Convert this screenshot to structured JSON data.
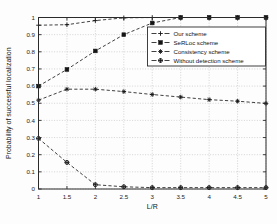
{
  "chart_data": {
    "type": "line",
    "title": "",
    "xlabel": "L/R",
    "ylabel": "Probability of successful localization",
    "xlim": [
      1,
      5
    ],
    "ylim": [
      0,
      1
    ],
    "grid": true,
    "legend_position": "upper right",
    "x": [
      1,
      1.5,
      2,
      2.5,
      3,
      3.5,
      4,
      4.5,
      5
    ],
    "xticks": [
      "1",
      "1.5",
      "2",
      "2.5",
      "3",
      "3.5",
      "4",
      "4.5",
      "5"
    ],
    "yticks": [
      "0",
      "0.1",
      "0.2",
      "0.3",
      "0.4",
      "0.5",
      "0.6",
      "0.7",
      "0.8",
      "0.9",
      "1"
    ],
    "series": [
      {
        "name": "Our scheme",
        "marker": "plus",
        "linestyle": "dashed",
        "values": [
          0.955,
          0.958,
          0.982,
          0.998,
          1.0,
          1.0,
          1.0,
          1.0,
          1.0
        ]
      },
      {
        "name": "SeRLoc scheme",
        "marker": "square",
        "linestyle": "dashed",
        "values": [
          0.6,
          0.697,
          0.805,
          0.9,
          0.968,
          1.0,
          1.0,
          1.0,
          1.0
        ]
      },
      {
        "name": "Consistency scheme",
        "marker": "asterisk",
        "linestyle": "dashed",
        "values": [
          0.518,
          0.582,
          0.582,
          0.568,
          0.551,
          0.536,
          0.521,
          0.512,
          0.499
        ]
      },
      {
        "name": "Without detection scheme",
        "marker": "hexagram",
        "linestyle": "dashed",
        "values": [
          0.295,
          0.155,
          0.025,
          0.013,
          0.008,
          0.008,
          0.008,
          0.008,
          0.008
        ]
      }
    ]
  },
  "legend": {
    "entries": [
      {
        "label": "Our scheme",
        "marker": "plus-icon"
      },
      {
        "label": "SeRLoc scheme",
        "marker": "square-icon"
      },
      {
        "label": "Consistency scheme",
        "marker": "asterisk-icon"
      },
      {
        "label": "Without detection scheme",
        "marker": "hexagram-icon"
      }
    ]
  },
  "axes": {
    "x_title": "L/R",
    "y_title": "Probability of successful localization",
    "x_tick_labels": [
      "1",
      "1.5",
      "2",
      "2.5",
      "3",
      "3.5",
      "4",
      "4.5",
      "5"
    ],
    "y_tick_labels": [
      "0",
      "0.1",
      "0.2",
      "0.3",
      "0.4",
      "0.5",
      "0.6",
      "0.7",
      "0.8",
      "0.9",
      "1"
    ]
  },
  "style": {
    "line_color": "#1e1e1e",
    "grid_color": "#b9b9b9",
    "axis_color": "#2a2a2a",
    "background": "#ffffff"
  }
}
